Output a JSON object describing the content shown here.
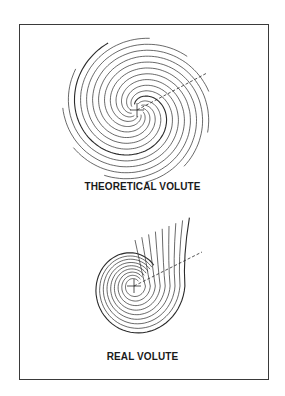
{
  "figure": {
    "panels": [
      {
        "id": "theoretical",
        "caption": "THEORETICAL VOLUTE",
        "turns": 5.5,
        "arms": 2,
        "has_center_cross": true,
        "has_dashed_radius": true
      },
      {
        "id": "real",
        "caption": "REAL VOLUTE",
        "nested_curves": 9,
        "has_center_cross": true,
        "has_dashed_radius": true
      }
    ],
    "colors": {
      "line": "#2a2a2a",
      "background": "#ffffff",
      "frame": "#3a3a3a"
    }
  }
}
